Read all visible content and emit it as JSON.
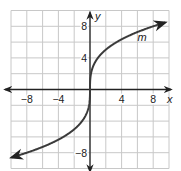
{
  "chart_data": {
    "type": "line",
    "title": "",
    "xlabel": "x",
    "ylabel": "y",
    "xlim": [
      -10,
      10
    ],
    "ylim": [
      -10,
      10
    ],
    "grid": true,
    "grid_step": 2,
    "x_ticks": [
      {
        "value": -8,
        "label": "−8"
      },
      {
        "value": -4,
        "label": "−4"
      },
      {
        "value": 4,
        "label": "4"
      },
      {
        "value": 8,
        "label": "8"
      }
    ],
    "y_ticks": [
      {
        "value": 8,
        "label": "8"
      },
      {
        "value": 4,
        "label": "4"
      },
      {
        "value": -8,
        "label": "−8"
      }
    ],
    "series": [
      {
        "name": "m",
        "function": "y = 4 * cbrt(x)",
        "x": [
          -9.9,
          -8,
          -6,
          -4,
          -2,
          -1,
          -0.5,
          -0.125,
          0,
          0.125,
          0.5,
          1,
          2,
          4,
          6,
          8,
          9.5
        ],
        "y": [
          -8.6,
          -8,
          -7.27,
          -6.35,
          -5.04,
          -4,
          -3.17,
          -2,
          0,
          2,
          3.17,
          4,
          5.04,
          6.35,
          7.27,
          8,
          8.48
        ],
        "arrows": "both"
      }
    ],
    "annotations": [
      {
        "text": "m",
        "x": 6,
        "y": 6.2
      }
    ]
  }
}
